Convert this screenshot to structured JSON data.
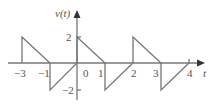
{
  "figure": {
    "y_axis_label": "v(t)",
    "x_axis_label": "t",
    "y_ticks": [
      {
        "value": 2,
        "label": "2"
      },
      {
        "value": -2,
        "label": "−2"
      }
    ],
    "x_ticks": [
      {
        "value": -3,
        "label": "−3"
      },
      {
        "value": -1,
        "label": "−1"
      },
      {
        "value": 0,
        "label": "0"
      },
      {
        "value": 1,
        "label": "1"
      },
      {
        "value": 2,
        "label": "2"
      },
      {
        "value": 3,
        "label": "3"
      },
      {
        "value": 4,
        "label": "4"
      }
    ],
    "line_color": "#777777",
    "waveform": {
      "type": "piecewise-linear",
      "points": [
        [
          -3,
          0
        ],
        [
          -3,
          2
        ],
        [
          -1,
          0
        ],
        [
          -1,
          -2
        ],
        [
          0,
          0
        ],
        [
          0,
          2
        ],
        [
          1,
          0
        ],
        [
          1,
          -2
        ],
        [
          2,
          0
        ],
        [
          2,
          2
        ],
        [
          3,
          0
        ],
        [
          3,
          -2
        ],
        [
          4,
          0
        ]
      ]
    }
  }
}
